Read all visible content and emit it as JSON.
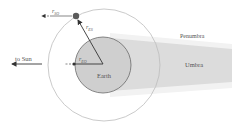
{
  "diagram": {
    "labels": {
      "to_sun": "to Sun",
      "earth": "Earth",
      "penumbra": "Penumbra",
      "umbra": "Umbra",
      "r_so": "r",
      "r_so_sub": "SO",
      "r_es": "r",
      "r_es_sub": "ES",
      "r_eo": "r",
      "r_eo_sub": "EO"
    },
    "colors": {
      "earth_fill": "#cfcfcf",
      "earth_stroke": "#6a6a6a",
      "orbit_stroke": "#bdbdbd",
      "umbra_fill": "#dedede",
      "penumbra_fill": "#f0f0f0",
      "satellite": "#5a5a5a",
      "arrow": "#333333"
    }
  }
}
